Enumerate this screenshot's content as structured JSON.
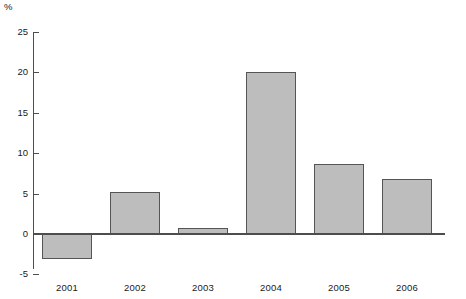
{
  "chart_data": {
    "type": "bar",
    "title": "",
    "subtitle": "",
    "xlabel": "",
    "ylabel": "%",
    "categories": [
      "2001",
      "2002",
      "2003",
      "2004",
      "2005",
      "2006"
    ],
    "values": [
      -3.1,
      5.2,
      0.8,
      20.1,
      8.7,
      6.8
    ],
    "series": [
      {
        "name": "",
        "values": [
          -3.1,
          5.2,
          0.8,
          20.1,
          8.7,
          6.8
        ]
      }
    ],
    "ylim": [
      -5,
      25
    ],
    "yticks": [
      25,
      20,
      15,
      10,
      5,
      0,
      -5
    ],
    "ytick_labels": [
      "25",
      "20",
      "15",
      "10",
      "5",
      "0",
      "-5"
    ],
    "grid": false,
    "legend": false,
    "legend_position": "none",
    "bar_fill_color": "#bdbdbd",
    "bar_border_color": "#555555",
    "axis_color": "#4d4d4d",
    "background_color": "#ffffff",
    "text_color": "#1a1a1a"
  }
}
